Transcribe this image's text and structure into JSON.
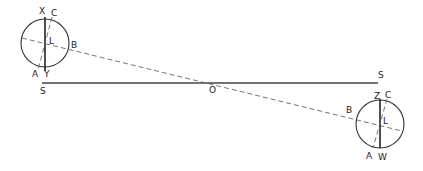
{
  "diagram": {
    "type": "geometric-construction",
    "center_label": "O",
    "baseline_labels": {
      "left": "S",
      "right": "S"
    },
    "left_circle": {
      "labels": {
        "top_axis": "X",
        "bottom_axis": "Y",
        "top_tilt": "C",
        "bottom_tilt": "A",
        "side": "B",
        "center": "L"
      }
    },
    "right_circle": {
      "labels": {
        "top_axis": "Z",
        "bottom_axis": "W",
        "top_tilt": "C",
        "bottom_tilt": "A",
        "side": "B",
        "center": "L"
      }
    }
  }
}
